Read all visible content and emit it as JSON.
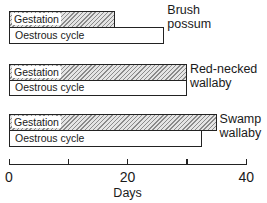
{
  "chart_data": {
    "type": "bar",
    "orientation": "horizontal",
    "title": "",
    "xlabel": "Days",
    "ylabel": "",
    "xlim": [
      0,
      40
    ],
    "xticks": [
      0,
      10,
      20,
      30,
      40
    ],
    "xtick_labels": [
      "0",
      "",
      "20",
      "",
      "40"
    ],
    "grid": false,
    "legend": "inline labels inside bars",
    "categories": [
      "Brush possum",
      "Red-necked wallaby",
      "Swamp wallaby"
    ],
    "series": [
      {
        "name": "Gestation",
        "style": "hatched",
        "values": [
          17.8,
          30,
          35
        ]
      },
      {
        "name": "Oestrous cycle",
        "style": "open",
        "values": [
          26.2,
          30,
          32.5
        ]
      }
    ]
  },
  "labels": {
    "gestation": "Gestation",
    "oestrous": "Oestrous cycle",
    "species": [
      {
        "line1": "Brush",
        "line2": "possum"
      },
      {
        "line1": "Red-necked",
        "line2": "wallaby"
      },
      {
        "line1": "Swamp",
        "line2": "wallaby"
      }
    ],
    "ticks": [
      "0",
      "20",
      "40"
    ],
    "axis_title": "Days"
  }
}
